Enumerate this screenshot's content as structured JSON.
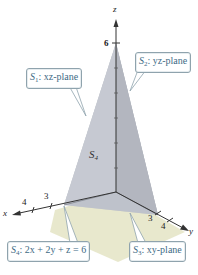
{
  "figure": {
    "axes": {
      "z": {
        "label": "z",
        "tick_label": "6"
      },
      "x": {
        "label": "x",
        "tick_labels": [
          "3",
          "4"
        ]
      },
      "y": {
        "label": "y",
        "tick_labels": [
          "3",
          "4"
        ]
      }
    },
    "surface_label": {
      "prefix": "S",
      "sub": "4"
    },
    "callouts": {
      "s1": {
        "prefix": "S",
        "sub": "1",
        "text": ": xz-plane"
      },
      "s2": {
        "prefix": "S",
        "sub": "2",
        "text": ": yz-plane"
      },
      "s3": {
        "prefix": "S",
        "sub": "3",
        "text": ": xy-plane"
      },
      "s4": {
        "prefix": "S",
        "sub": "4",
        "text": ": 2x + 2y + z = 6"
      }
    },
    "colors": {
      "left_face": "#c9ccd3",
      "right_face": "#9ea2ab",
      "front_face": "#b7bcc5",
      "base_plane": "#e6e6c8",
      "callout_text": "#3e6b85",
      "callout_border": "#8fa3ad"
    }
  }
}
